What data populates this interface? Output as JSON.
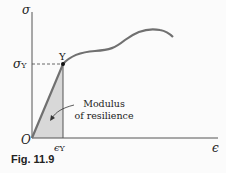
{
  "figure": {
    "caption": "Fig. 11.9",
    "y_axis_label": "σ",
    "x_axis_label": "ϵ",
    "origin_label": "O",
    "yield_point_label": "Y",
    "yield_stress_label": "σ",
    "yield_stress_sub": "Y",
    "yield_strain_label": "ϵ",
    "yield_strain_sub": "Y",
    "annotation_line1": "Modulus",
    "annotation_line2": "of resilience"
  },
  "colors": {
    "curve": "#6e6e6e",
    "shade": "#d8d8d8",
    "axis": "#444444"
  }
}
